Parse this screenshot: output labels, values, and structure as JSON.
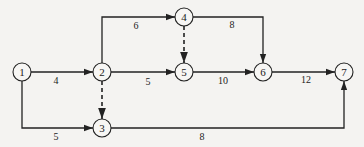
{
  "diagram": {
    "type": "activity-on-arrow network",
    "nodes": [
      {
        "id": "1",
        "label": "1",
        "x": 22,
        "y": 72
      },
      {
        "id": "2",
        "label": "2",
        "x": 102,
        "y": 72
      },
      {
        "id": "3",
        "label": "3",
        "x": 102,
        "y": 128
      },
      {
        "id": "4",
        "label": "4",
        "x": 184,
        "y": 17
      },
      {
        "id": "5",
        "label": "5",
        "x": 184,
        "y": 72
      },
      {
        "id": "6",
        "label": "6",
        "x": 263,
        "y": 72
      },
      {
        "id": "7",
        "label": "7",
        "x": 344,
        "y": 72
      }
    ],
    "edges": [
      {
        "from": "1",
        "to": "2",
        "duration": "4",
        "dummy": false
      },
      {
        "from": "1",
        "to": "3",
        "duration": "5",
        "dummy": false
      },
      {
        "from": "2",
        "to": "4",
        "duration": "6",
        "dummy": false
      },
      {
        "from": "2",
        "to": "5",
        "duration": "5",
        "dummy": false
      },
      {
        "from": "2",
        "to": "3",
        "duration": "",
        "dummy": true
      },
      {
        "from": "4",
        "to": "5",
        "duration": "",
        "dummy": true
      },
      {
        "from": "4",
        "to": "6",
        "duration": "8",
        "dummy": false
      },
      {
        "from": "5",
        "to": "6",
        "duration": "10",
        "dummy": false
      },
      {
        "from": "6",
        "to": "7",
        "duration": "12",
        "dummy": false
      },
      {
        "from": "3",
        "to": "7",
        "duration": "8",
        "dummy": false
      }
    ]
  }
}
